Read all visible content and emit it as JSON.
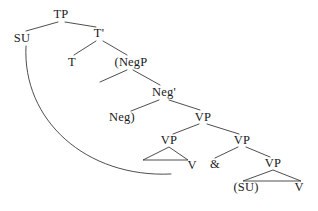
{
  "figure": {
    "kind": "syntax-tree",
    "background_color": "#ffffff",
    "line_color": "#3a3a3a",
    "text_color": "#1a1a1a",
    "width": 318,
    "height": 211
  },
  "nodes": [
    {
      "id": "tp",
      "label": "TP",
      "x": 61,
      "y": 14
    },
    {
      "id": "su",
      "label": "SU",
      "x": 22,
      "y": 38
    },
    {
      "id": "tbar",
      "label": "T'",
      "x": 99,
      "y": 33
    },
    {
      "id": "t",
      "label": "T",
      "x": 72,
      "y": 62
    },
    {
      "id": "negp",
      "label": "(NegP",
      "x": 131,
      "y": 62
    },
    {
      "id": "negbar",
      "label": "Neg'",
      "x": 164,
      "y": 92
    },
    {
      "id": "neg",
      "label": "Neg)",
      "x": 122,
      "y": 117
    },
    {
      "id": "vp-top",
      "label": "VP",
      "x": 203,
      "y": 117
    },
    {
      "id": "vp-left",
      "label": "VP",
      "x": 169,
      "y": 140
    },
    {
      "id": "vp-right",
      "label": "VP",
      "x": 242,
      "y": 140
    },
    {
      "id": "v-left",
      "label": "V",
      "x": 192,
      "y": 165
    },
    {
      "id": "conj",
      "label": "&",
      "x": 215,
      "y": 164
    },
    {
      "id": "vp-bottom",
      "label": "VP",
      "x": 273,
      "y": 163
    },
    {
      "id": "su-trace",
      "label": "(SU)",
      "x": 246,
      "y": 187
    },
    {
      "id": "v-right",
      "label": "V",
      "x": 299,
      "y": 187
    }
  ],
  "branches": [
    {
      "id": "tp-su",
      "from": "TP",
      "to": "SU",
      "x1": 58,
      "y1": 22,
      "x2": 26,
      "y2": 31
    },
    {
      "id": "tp-tbar",
      "from": "TP",
      "to": "T'",
      "x1": 65,
      "y1": 22,
      "x2": 96,
      "y2": 27
    },
    {
      "id": "tbar-t",
      "from": "T'",
      "to": "T",
      "x1": 96,
      "y1": 41,
      "x2": 74,
      "y2": 55
    },
    {
      "id": "tbar-negp",
      "from": "T'",
      "to": "(NegP",
      "x1": 103,
      "y1": 41,
      "x2": 127,
      "y2": 55
    },
    {
      "id": "negp-spec",
      "from": "(NegP",
      "to": "",
      "x1": 127,
      "y1": 70,
      "x2": 100,
      "y2": 82
    },
    {
      "id": "negp-negbar",
      "from": "(NegP",
      "to": "Neg'",
      "x1": 133,
      "y1": 70,
      "x2": 160,
      "y2": 85
    },
    {
      "id": "negbar-neg",
      "from": "Neg'",
      "to": "Neg)",
      "x1": 159,
      "y1": 100,
      "x2": 131,
      "y2": 111
    },
    {
      "id": "negbar-vp",
      "from": "Neg'",
      "to": "VP",
      "x1": 169,
      "y1": 100,
      "x2": 200,
      "y2": 110
    },
    {
      "id": "vptop-vpleft",
      "from": "VP",
      "to": "VP",
      "x1": 199,
      "y1": 124,
      "x2": 173,
      "y2": 134
    },
    {
      "id": "vptop-vpright",
      "from": "VP",
      "to": "VP",
      "x1": 207,
      "y1": 124,
      "x2": 239,
      "y2": 134
    },
    {
      "id": "vpright-conj",
      "from": "VP",
      "to": "&",
      "x1": 238,
      "y1": 147,
      "x2": 215,
      "y2": 158
    },
    {
      "id": "vpright-vpbottom",
      "from": "VP",
      "to": "VP",
      "x1": 246,
      "y1": 147,
      "x2": 270,
      "y2": 157
    }
  ],
  "triangles": [
    {
      "id": "vp-left-triangle",
      "parent": "VP",
      "apex_x": 169,
      "apex_y": 147,
      "base_left_x": 143,
      "base_left_y": 160,
      "base_right_x": 188,
      "base_right_y": 160
    },
    {
      "id": "vp-bottom-triangle",
      "parent": "VP",
      "apex_x": 273,
      "apex_y": 170,
      "base_left_x": 243,
      "base_left_y": 181,
      "base_right_x": 301,
      "base_right_y": 181
    }
  ],
  "movement_arc": {
    "id": "su-movement-arc",
    "from_node": "SU",
    "to_node": "vp-left-triangle-base",
    "start_x": 26,
    "start_y": 46,
    "control1_x": 22,
    "control2_x": 86,
    "control1_y": 120,
    "control2_y": 178,
    "end_x": 171,
    "end_y": 174
  }
}
